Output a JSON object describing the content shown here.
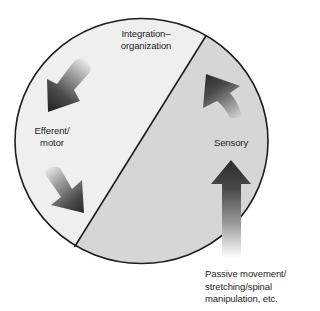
{
  "diagram": {
    "colors": {
      "background": "#ffffff",
      "integration_half": "#efefef",
      "sensory_half": "#d6d6d6",
      "outline": "#1e1e1e",
      "arrow_dark": "#2a2a2a",
      "arrow_light": "#ffffff"
    },
    "regions": [
      {
        "name": "integration-motor-half",
        "side": "upper-left"
      },
      {
        "name": "sensory-half",
        "side": "lower-right"
      }
    ],
    "labels": {
      "integration": {
        "line1": "Integration–",
        "line2": "organization"
      },
      "efferent": {
        "line1": "Efferent/",
        "line2": "motor"
      },
      "sensory": {
        "line1": "Sensory"
      },
      "input": {
        "line1": "Passive movement/",
        "line2": "stretching/spinal",
        "line3": "manipulation, etc."
      }
    },
    "arrows": [
      {
        "name": "efferent-arrow-upper",
        "direction": "down-left",
        "icon": "arrow-down-left-icon"
      },
      {
        "name": "efferent-arrow-lower",
        "direction": "down-right",
        "icon": "arrow-down-right-icon"
      },
      {
        "name": "sensory-curved-arrow",
        "direction": "up-left",
        "icon": "curved-arrow-up-icon"
      },
      {
        "name": "input-arrow",
        "direction": "up",
        "icon": "arrow-up-icon"
      }
    ]
  }
}
